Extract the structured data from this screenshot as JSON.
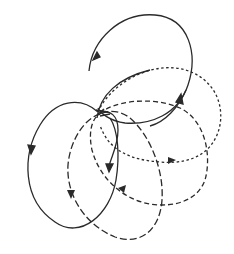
{
  "figure": {
    "type": "looping trajectory diagram",
    "background": "#ffffff",
    "stroke_color": "#2a2a2a",
    "curves": [
      {
        "name": "solid-upper-arc",
        "style": "solid",
        "arrow": "down-left"
      },
      {
        "name": "solid-left-ellipse",
        "style": "solid",
        "arrow": "down"
      },
      {
        "name": "dotted-right-ellipse",
        "style": "dotted",
        "arrow": "right"
      },
      {
        "name": "dashed-middle-ellipse",
        "style": "dashed",
        "arrow": "up-left"
      },
      {
        "name": "long-dash-lower-ellipse",
        "style": "long-dashed",
        "arrow": "down"
      }
    ]
  }
}
